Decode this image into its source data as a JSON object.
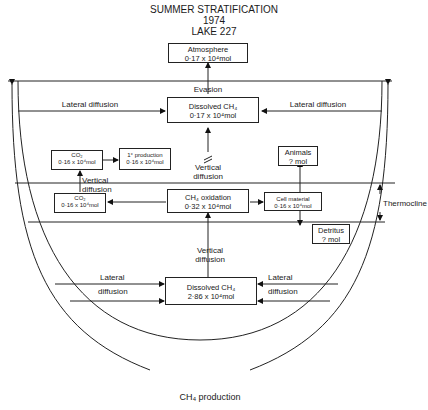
{
  "title": {
    "line1": "SUMMER STRATIFICATION",
    "line2": "1974",
    "line3": "LAKE 227"
  },
  "boxes": {
    "atmosphere": {
      "label": "Atmosphere",
      "value": "0·17 x 10⁴mol"
    },
    "dissolved_upper": {
      "label": "Dissolved CH₄",
      "value": "0·17 x 10⁴mol"
    },
    "co2_upper": {
      "label": "CO₂",
      "value": "0·16 x 10⁴mol"
    },
    "primary_production": {
      "label": "1° production",
      "value": "0·16 x 10⁴mol"
    },
    "co2_lower": {
      "label": "CO₂",
      "value": "0·16 x 10⁴mol"
    },
    "ch4_oxidation": {
      "label": "CH₄ oxidation",
      "value": "0·32 x 10⁴mol"
    },
    "animals": {
      "label": "Animals",
      "value": "? mol"
    },
    "cell_material": {
      "label": "Cell material",
      "value": "0·16 x 10⁴mol"
    },
    "detritus": {
      "label": "Detritus",
      "value": "? mol"
    },
    "dissolved_lower": {
      "label": "Dissolved CH₄",
      "value": "2·86 x 10⁴mol"
    }
  },
  "labels": {
    "evasion": "Evasion",
    "lateral_left_upper": "Lateral diffusion",
    "lateral_right_upper": "Lateral diffusion",
    "vertical_diffusion_mid": [
      "Vertical",
      "diffusion"
    ],
    "vertical_diffusion_left": [
      "Vertical",
      "diffusion"
    ],
    "vertical_diffusion_lower": [
      "Vertical",
      "diffusion"
    ],
    "lateral_left_lower": [
      "Lateral",
      "diffusion"
    ],
    "lateral_right_lower": [
      "Lateral",
      "diffusion"
    ],
    "thermocline": "Thermocline",
    "ch4_production": "CH₄ production"
  }
}
